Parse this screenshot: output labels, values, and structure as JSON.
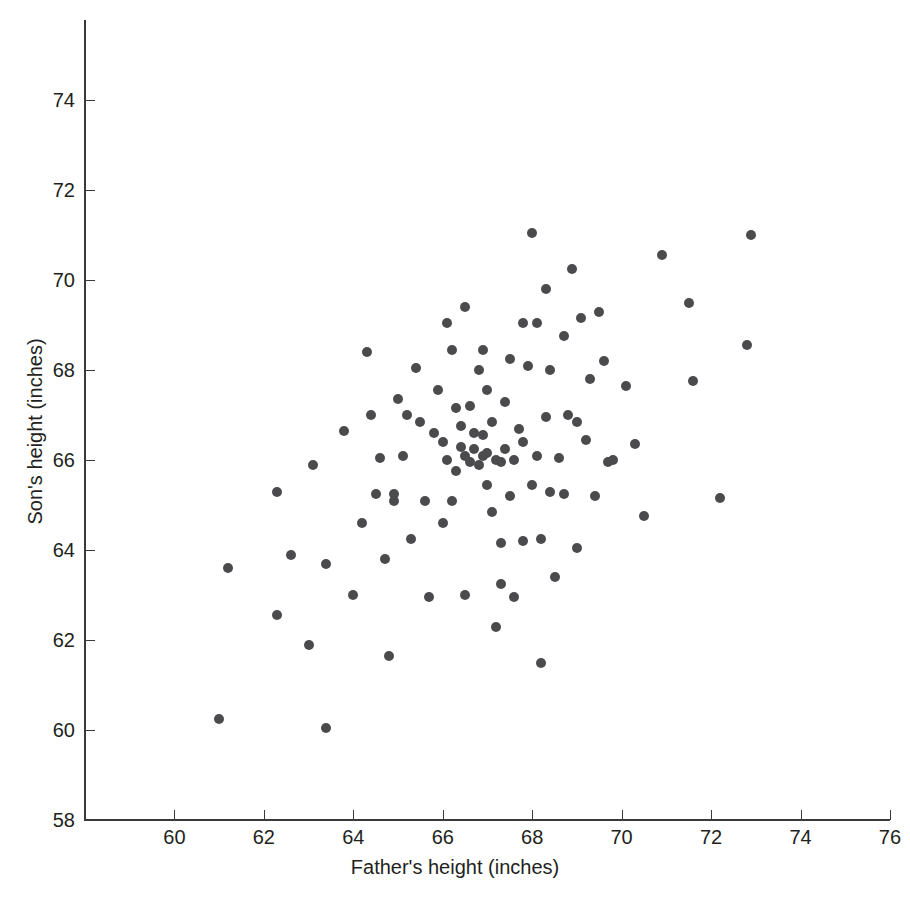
{
  "figure": {
    "background_color": "#ffffff",
    "axis_color": "#3a3a3a",
    "marker_color": "#4b4b4d"
  },
  "chart_data": {
    "type": "scatter",
    "title": "",
    "subtitle": "",
    "xlabel": "Father's height (inches)",
    "ylabel": "Son's height (inches)",
    "xlim": [
      58,
      76
    ],
    "ylim": [
      58,
      75.4
    ],
    "xticks": [
      60,
      62,
      64,
      66,
      68,
      70,
      72,
      74,
      76
    ],
    "yticks": [
      58,
      60,
      62,
      64,
      66,
      68,
      70,
      72,
      74
    ],
    "xticklabels": [
      "60",
      "62",
      "64",
      "66",
      "68",
      "70",
      "72",
      "74",
      "76"
    ],
    "yticklabels": [
      "58",
      "60",
      "62",
      "64",
      "66",
      "68",
      "70",
      "72",
      "74"
    ],
    "grid": false,
    "legend": null,
    "annotations": [],
    "marker": "filled-circle",
    "n_points": 108,
    "series": [
      {
        "name": "Father-son heights",
        "points": [
          [
            61.0,
            60.25
          ],
          [
            61.2,
            63.6
          ],
          [
            62.3,
            65.3
          ],
          [
            62.3,
            62.55
          ],
          [
            62.6,
            63.9
          ],
          [
            63.0,
            61.9
          ],
          [
            63.1,
            65.9
          ],
          [
            63.4,
            60.05
          ],
          [
            63.4,
            63.7
          ],
          [
            63.8,
            66.65
          ],
          [
            64.0,
            63.0
          ],
          [
            64.2,
            64.6
          ],
          [
            64.3,
            68.4
          ],
          [
            64.4,
            67.0
          ],
          [
            64.5,
            65.25
          ],
          [
            64.6,
            66.05
          ],
          [
            64.7,
            63.8
          ],
          [
            64.8,
            61.65
          ],
          [
            64.9,
            65.1
          ],
          [
            65.0,
            67.35
          ],
          [
            65.1,
            66.1
          ],
          [
            65.3,
            64.25
          ],
          [
            65.4,
            68.05
          ],
          [
            65.5,
            66.85
          ],
          [
            65.6,
            65.1
          ],
          [
            65.7,
            62.95
          ],
          [
            65.9,
            67.55
          ],
          [
            66.0,
            66.4
          ],
          [
            66.1,
            69.05
          ],
          [
            66.1,
            66.0
          ],
          [
            66.2,
            68.45
          ],
          [
            66.3,
            67.15
          ],
          [
            66.3,
            65.75
          ],
          [
            66.4,
            66.3
          ],
          [
            66.4,
            66.75
          ],
          [
            66.5,
            66.1
          ],
          [
            66.5,
            69.4
          ],
          [
            66.6,
            65.95
          ],
          [
            66.6,
            67.2
          ],
          [
            66.7,
            66.6
          ],
          [
            66.7,
            66.25
          ],
          [
            66.8,
            68.0
          ],
          [
            66.8,
            65.9
          ],
          [
            66.9,
            66.55
          ],
          [
            66.9,
            66.1
          ],
          [
            67.0,
            65.45
          ],
          [
            67.0,
            66.15
          ],
          [
            67.1,
            66.85
          ],
          [
            67.1,
            64.85
          ],
          [
            67.2,
            62.3
          ],
          [
            67.2,
            66.0
          ],
          [
            67.3,
            63.25
          ],
          [
            67.3,
            64.15
          ],
          [
            67.4,
            67.3
          ],
          [
            67.4,
            66.25
          ],
          [
            67.5,
            65.2
          ],
          [
            67.5,
            68.25
          ],
          [
            67.6,
            66.0
          ],
          [
            67.7,
            66.7
          ],
          [
            67.8,
            66.4
          ],
          [
            67.8,
            64.2
          ],
          [
            67.9,
            68.1
          ],
          [
            68.0,
            65.45
          ],
          [
            68.0,
            71.05
          ],
          [
            68.1,
            66.1
          ],
          [
            68.1,
            69.05
          ],
          [
            68.2,
            61.5
          ],
          [
            68.2,
            64.25
          ],
          [
            68.3,
            66.95
          ],
          [
            68.3,
            69.8
          ],
          [
            68.4,
            65.3
          ],
          [
            68.5,
            63.4
          ],
          [
            68.6,
            66.05
          ],
          [
            68.7,
            68.75
          ],
          [
            68.8,
            67.0
          ],
          [
            68.9,
            70.25
          ],
          [
            69.0,
            64.05
          ],
          [
            69.1,
            69.15
          ],
          [
            69.2,
            66.45
          ],
          [
            69.3,
            67.8
          ],
          [
            69.4,
            65.2
          ],
          [
            69.5,
            69.3
          ],
          [
            69.6,
            68.2
          ],
          [
            69.8,
            66.0
          ],
          [
            70.1,
            67.65
          ],
          [
            70.3,
            66.35
          ],
          [
            70.5,
            64.75
          ],
          [
            70.9,
            70.55
          ],
          [
            71.5,
            69.5
          ],
          [
            71.6,
            67.75
          ],
          [
            72.2,
            65.15
          ],
          [
            72.8,
            68.55
          ],
          [
            72.9,
            71.0
          ],
          [
            64.9,
            65.25
          ],
          [
            65.2,
            67.0
          ],
          [
            66.0,
            64.6
          ],
          [
            66.5,
            63.0
          ],
          [
            67.6,
            62.95
          ],
          [
            68.7,
            65.25
          ],
          [
            69.0,
            66.85
          ],
          [
            67.0,
            67.55
          ],
          [
            66.9,
            68.45
          ],
          [
            67.8,
            69.05
          ],
          [
            65.8,
            66.6
          ],
          [
            67.3,
            65.95
          ],
          [
            68.4,
            68.0
          ],
          [
            66.2,
            65.1
          ],
          [
            69.7,
            65.95
          ]
        ]
      }
    ]
  }
}
